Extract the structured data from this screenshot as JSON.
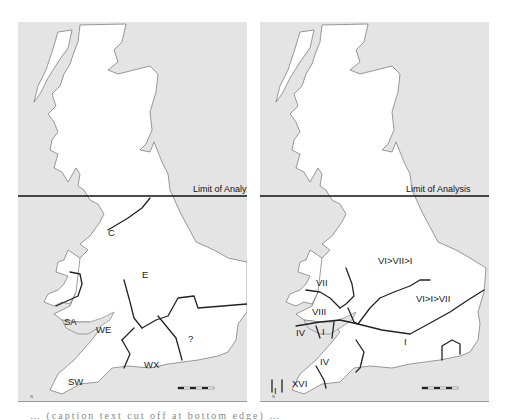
{
  "figure": {
    "limit_label": "Limit of Analysis",
    "caption_partial": "… (caption text cut off at bottom edge) …",
    "colors": {
      "sea": "#e4e4e4",
      "land": "#ffffff",
      "boundary": "#222222"
    }
  },
  "left_map": {
    "limit_label": "Limit of Analysis",
    "regions": [
      {
        "id": "C",
        "label": "C"
      },
      {
        "id": "E",
        "label": "E"
      },
      {
        "id": "SA",
        "label": "SA"
      },
      {
        "id": "WE",
        "label": "WE"
      },
      {
        "id": "unknown",
        "label": "?"
      },
      {
        "id": "WX",
        "label": "WX"
      },
      {
        "id": "SW",
        "label": "SW"
      }
    ]
  },
  "right_map": {
    "limit_label": "Limit of Analysis",
    "regions": [
      {
        "id": "VI>VII>I",
        "label": "VI>VII>I"
      },
      {
        "id": "VII",
        "label": "VII"
      },
      {
        "id": "VIII",
        "label": "VIII"
      },
      {
        "id": "VI>I>VII",
        "label": "VI>I>VII"
      },
      {
        "id": "IV-wales",
        "label": "IV"
      },
      {
        "id": "I-small",
        "label": "I"
      },
      {
        "id": "I",
        "label": "I"
      },
      {
        "id": "IV",
        "label": "IV"
      },
      {
        "id": "XVI",
        "label": "XVI"
      },
      {
        "id": "I-cornwall",
        "label": "I"
      }
    ]
  }
}
